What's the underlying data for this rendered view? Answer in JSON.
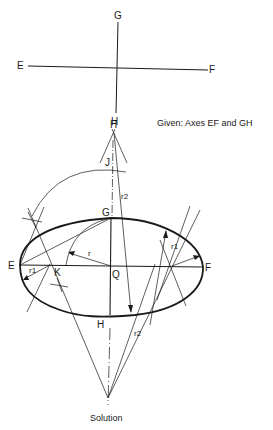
{
  "given": {
    "caption": "Given: Axes EF and GH",
    "labels": {
      "G": "G",
      "E": "E",
      "F": "F",
      "H": "H"
    }
  },
  "solution": {
    "caption": "Solution",
    "labels": {
      "H_top": "H",
      "J": "J",
      "G": "G",
      "E": "E",
      "F": "F",
      "K": "K",
      "Q": "Q",
      "H": "H",
      "r": "r",
      "r1_left": "r1",
      "r1_right": "r1",
      "r2_upper": "r2",
      "r2_lower": "r2"
    }
  },
  "colors": {
    "ink": "#1a1a1a",
    "background": "#ffffff"
  }
}
